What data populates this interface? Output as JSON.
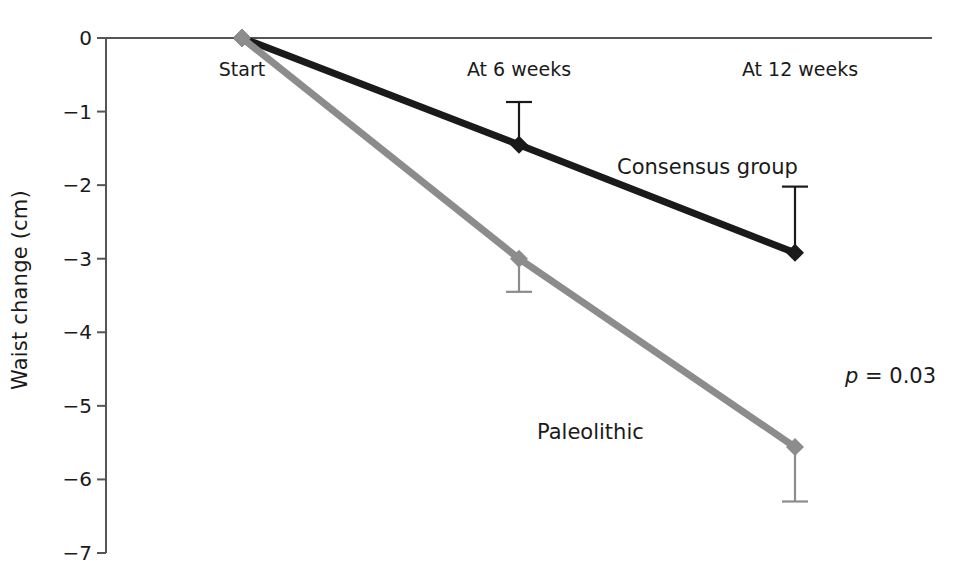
{
  "chart_data": {
    "type": "line",
    "title": "",
    "xlabel": "",
    "ylabel": "Waist change (cm)",
    "categories": [
      "Start",
      "At 6 weeks",
      "At 12 weeks"
    ],
    "ylim": [
      -7,
      0
    ],
    "yticks": [
      "0",
      "−1",
      "−2",
      "−3",
      "−4",
      "−5",
      "−6",
      "−7"
    ],
    "ytick_values": [
      0,
      -1,
      -2,
      -3,
      -4,
      -5,
      -6,
      -7
    ],
    "grid": false,
    "legend_position": "inline-annotation",
    "series": [
      {
        "name": "Consensus group",
        "color": "#1a1a1a",
        "marker": "diamond",
        "values": [
          0,
          -1.45,
          -2.92
        ],
        "error_upper": [
          0,
          0.58,
          0.9
        ],
        "error_lower": [
          0,
          0,
          0
        ],
        "error_bar_direction": "up"
      },
      {
        "name": "Paleolithic",
        "color": "#8c8c8c",
        "marker": "diamond",
        "values": [
          0,
          -3.0,
          -5.56
        ],
        "error_upper": [
          0,
          0,
          0
        ],
        "error_lower": [
          0,
          0.45,
          0.74
        ],
        "error_bar_direction": "down"
      }
    ],
    "annotations": [
      {
        "id": "consensus-label",
        "text": "Consensus group",
        "x_px": 617,
        "y_px": 155
      },
      {
        "id": "paleolithic-label",
        "text": "Paleolithic",
        "x_px": 537,
        "y_px": 420
      },
      {
        "id": "pvalue",
        "text": "p = 0.03",
        "p_symbol": "p",
        "p_rest": " = 0.03",
        "x_px": 845,
        "y_px": 364
      }
    ]
  },
  "axis": {
    "y_label": "Waist change (cm)",
    "ticks": [
      {
        "label": "0",
        "value": 0
      },
      {
        "label": "−1",
        "value": -1
      },
      {
        "label": "−2",
        "value": -2
      },
      {
        "label": "−3",
        "value": -3
      },
      {
        "label": "−4",
        "value": -4
      },
      {
        "label": "−5",
        "value": -5
      },
      {
        "label": "−6",
        "value": -6
      },
      {
        "label": "−7",
        "value": -7
      }
    ],
    "x_labels": [
      {
        "label": "Start",
        "x_px": 242
      },
      {
        "label": "At 6 weeks",
        "x_px": 519
      },
      {
        "label": "At 12 weeks",
        "x_px": 800
      }
    ]
  },
  "colors": {
    "consensus": "#1a1a1a",
    "paleolithic": "#8c8c8c",
    "axis": "#555555",
    "text": "#1a1a1a"
  },
  "geometry": {
    "y_zero_px": 38,
    "y_unit_px": 73.57,
    "axis_x_px": 106,
    "zero_line_right_px": 932,
    "x_positions_px": [
      242,
      519,
      795
    ]
  }
}
